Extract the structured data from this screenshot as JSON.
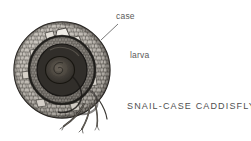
{
  "figure": {
    "title": "SNAIL-CASE CADDISFLY",
    "style": "pen-and-ink stipple scientific illustration",
    "background_color": "#ffffff",
    "ink_color": "#2b2b2b",
    "text_color": "#5a5a5a",
    "labels": [
      {
        "id": "case",
        "text": "case",
        "has_leader_line": true,
        "leader_from": [
          118,
          24
        ],
        "leader_to": [
          101,
          40
        ]
      },
      {
        "id": "larva",
        "text": "larva",
        "has_leader_line": false
      }
    ],
    "illustration": {
      "type": "spiral-shell-case",
      "center": [
        62,
        70
      ],
      "outer_radius": 48,
      "whorls": 2.2,
      "core_radius": 13,
      "core_color": "#3a3632",
      "pebble_mosaic": true,
      "legs_count": 4,
      "legs_origin": [
        88,
        100
      ]
    }
  }
}
